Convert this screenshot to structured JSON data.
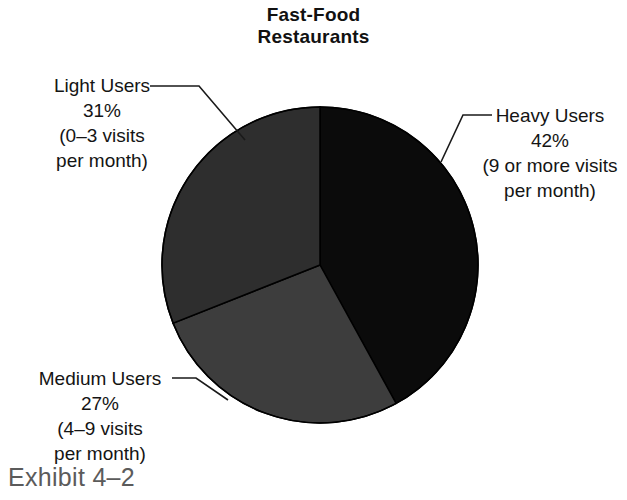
{
  "title": {
    "line1": "Fast-Food",
    "line2": "Restaurants"
  },
  "labels": {
    "light": {
      "name": "Light Users",
      "percent": "31%",
      "detail_line1": "(0–3 visits",
      "detail_line2": "per month)"
    },
    "heavy": {
      "name": "Heavy Users",
      "percent": "42%",
      "detail_line1": "(9 or more visits",
      "detail_line2": "per month)"
    },
    "medium": {
      "name": "Medium Users",
      "percent": "27%",
      "detail_line1": "(4–9 visits",
      "detail_line2": "per month)"
    }
  },
  "caption": "Exhibit 4–2",
  "colors": {
    "heavy": "#0b0b0b",
    "light": "#2e2e2e",
    "medium": "#3d3d3d",
    "slice_outline": "#000000",
    "leader_line": "#1a1a1a",
    "title_text": "#111111",
    "label_text": "#141414",
    "caption_text": "#5b5b5b",
    "background": "#ffffff"
  },
  "chart_data": {
    "type": "pie",
    "title": "Fast-Food Restaurants",
    "subtitle": "",
    "xlabel": "",
    "ylabel": "",
    "legend_position": "callout-labels",
    "grid": false,
    "start_angle_deg": 0,
    "direction": "clockwise",
    "categories": [
      "Heavy Users",
      "Medium Users",
      "Light Users"
    ],
    "values": [
      42,
      27,
      31
    ],
    "units": "percent",
    "slices": [
      {
        "label": "Heavy Users",
        "value": 42,
        "value_text": "42%",
        "detail": "(9 or more visits per month)",
        "color": "#0b0b0b",
        "start_angle_deg": 0,
        "end_angle_deg": 151.2
      },
      {
        "label": "Medium Users",
        "value": 27,
        "value_text": "27%",
        "detail": "(4–9 visits per month)",
        "color": "#3d3d3d",
        "start_angle_deg": 151.2,
        "end_angle_deg": 248.4
      },
      {
        "label": "Light Users",
        "value": 31,
        "value_text": "31%",
        "detail": "(0–3 visits per month)",
        "color": "#2e2e2e",
        "start_angle_deg": 248.4,
        "end_angle_deg": 360
      }
    ]
  }
}
